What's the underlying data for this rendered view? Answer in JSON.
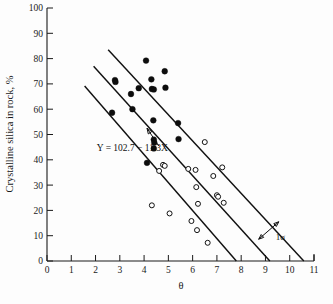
{
  "figure": {
    "background_color": "#fdfdfd",
    "ink_color": "#111111"
  },
  "chart_data": {
    "type": "scatter",
    "title": "",
    "subtitle": "",
    "xlabel": "θ",
    "ylabel": "Crystalline silica in rock, %",
    "xlim": [
      0,
      11
    ],
    "ylim": [
      0,
      100
    ],
    "xticks": [
      0,
      1,
      2,
      3,
      4,
      5,
      6,
      7,
      8,
      9,
      10,
      11
    ],
    "xtick_labels": [
      "0",
      "1",
      "2",
      "3",
      "4",
      "5",
      "6",
      "7",
      "8",
      "9",
      "10",
      "11"
    ],
    "yticks": [
      0,
      10,
      20,
      30,
      40,
      50,
      60,
      70,
      80,
      90,
      100
    ],
    "ytick_labels": [
      "0",
      "10",
      "20",
      "30",
      "40",
      "50",
      "60",
      "70",
      "80",
      "90",
      "100"
    ],
    "grid": false,
    "legend": null,
    "legend_position": "none",
    "series": [
      {
        "name": "filled-points",
        "marker": "filled-circle",
        "marker_color": "#0d0d0d",
        "points": [
          [
            2.8,
            71.5
          ],
          [
            2.82,
            70.8
          ],
          [
            2.68,
            58.6
          ],
          [
            3.46,
            66.0
          ],
          [
            3.52,
            60.0
          ],
          [
            3.78,
            68.3
          ],
          [
            4.08,
            79.2
          ],
          [
            4.12,
            38.8
          ],
          [
            4.3,
            71.8
          ],
          [
            4.32,
            68.0
          ],
          [
            4.4,
            67.8
          ],
          [
            4.38,
            55.6
          ],
          [
            4.4,
            48.0
          ],
          [
            4.42,
            46.8
          ],
          [
            4.4,
            44.5
          ],
          [
            4.85,
            75.0
          ],
          [
            4.88,
            68.5
          ],
          [
            5.4,
            54.5
          ],
          [
            5.42,
            48.2
          ]
        ]
      },
      {
        "name": "open-points",
        "marker": "open-circle",
        "marker_color": "#ffffff",
        "points": [
          [
            4.32,
            22.0
          ],
          [
            4.62,
            35.6
          ],
          [
            4.78,
            38.0
          ],
          [
            4.85,
            37.6
          ],
          [
            5.05,
            18.8
          ],
          [
            5.82,
            36.4
          ],
          [
            5.95,
            15.8
          ],
          [
            6.12,
            36.0
          ],
          [
            6.15,
            29.2
          ],
          [
            6.18,
            12.2
          ],
          [
            6.22,
            22.6
          ],
          [
            6.5,
            47.0
          ],
          [
            6.62,
            7.2
          ],
          [
            6.85,
            33.6
          ],
          [
            7.0,
            26.0
          ],
          [
            7.05,
            25.4
          ],
          [
            7.22,
            37.0
          ],
          [
            7.28,
            23.0
          ]
        ]
      }
    ],
    "fit_lines": [
      {
        "name": "upper-line",
        "label": "",
        "x_start": 2.52,
        "y_start": 83.5,
        "x_end": 10.58,
        "y_end": 0.0
      },
      {
        "name": "center-line",
        "label": "Y = 102.7 − 11.3X",
        "x_start": 1.92,
        "y_start": 77.0,
        "x_end": 9.18,
        "y_end": 0.0
      },
      {
        "name": "lower-line",
        "label": "",
        "x_start": 1.55,
        "y_start": 69.2,
        "x_end": 7.8,
        "y_end": 0.0
      }
    ],
    "annotations": [
      {
        "name": "regression-equation",
        "text": "Y = 102.7 − 11.3X",
        "x": 2.05,
        "y": 43.5,
        "arrow_to_x": 4.12,
        "arrow_to_y": 52.5
      },
      {
        "name": "sigma-annotation",
        "text": "1σ",
        "x": 9.42,
        "y": 8.2,
        "arrow_from_x": 8.72,
        "arrow_from_y": 8.6,
        "arrow_to_x": 9.55,
        "arrow_to_y": 15.5
      }
    ]
  }
}
